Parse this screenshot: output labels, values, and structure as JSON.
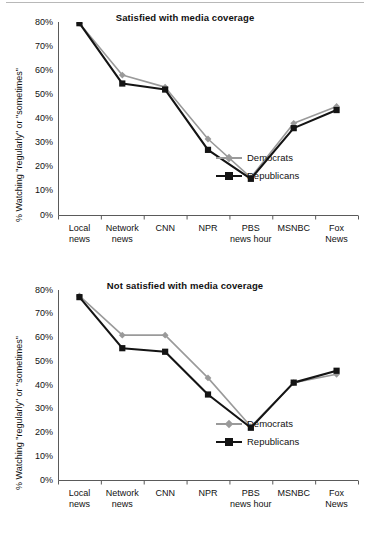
{
  "figure": {
    "background": "#ffffff",
    "ylabel": "% Watching \"regularly\" or \"sometimes\"",
    "ytick_labels": [
      "80%",
      "70%",
      "60%",
      "50%",
      "40%",
      "30%",
      "20%",
      "10%",
      "0%"
    ],
    "categories": [
      {
        "line1": "Local",
        "line2": "news"
      },
      {
        "line1": "Network",
        "line2": "news"
      },
      {
        "line1": "CNN",
        "line2": ""
      },
      {
        "line1": "NPR",
        "line2": ""
      },
      {
        "line1": "PBS",
        "line2": "news hour"
      },
      {
        "line1": "MSNBC",
        "line2": ""
      },
      {
        "line1": "Fox",
        "line2": "News"
      }
    ],
    "legend": {
      "democrats_label": "Democrats",
      "republicans_label": "Republicans"
    },
    "colors": {
      "democrats": "#9a9a9a",
      "republicans": "#141414",
      "axis": "#5a5a5a",
      "text": "#111111"
    }
  },
  "chart_data": [
    {
      "type": "line",
      "title": "Satisfied with media coverage",
      "xlabel": "",
      "ylabel": "% Watching \"regularly\" or \"sometimes\"",
      "ylim": [
        0,
        80
      ],
      "ytick_step": 10,
      "grid": false,
      "legend_position": "inside-right",
      "categories": [
        "Local news",
        "Network news",
        "CNN",
        "NPR",
        "PBS news hour",
        "MSNBC",
        "Fox News"
      ],
      "series": [
        {
          "name": "Democrats",
          "color": "#9a9a9a",
          "marker": "diamond",
          "values": [
            79.5,
            58,
            53,
            31.5,
            15.5,
            38,
            45
          ]
        },
        {
          "name": "Republicans",
          "color": "#141414",
          "marker": "square",
          "values": [
            79.5,
            54.5,
            52,
            27,
            15,
            36,
            43.5
          ]
        }
      ]
    },
    {
      "type": "line",
      "title": "Not satisfied with media coverage",
      "xlabel": "",
      "ylabel": "% Watching \"regularly\" or \"sometimes\"",
      "ylim": [
        0,
        80
      ],
      "ytick_step": 10,
      "grid": false,
      "legend_position": "inside-right",
      "categories": [
        "Local news",
        "Network news",
        "CNN",
        "NPR",
        "PBS news hour",
        "MSNBC",
        "Fox News"
      ],
      "series": [
        {
          "name": "Democrats",
          "color": "#9a9a9a",
          "marker": "diamond",
          "values": [
            77.5,
            61,
            61,
            43,
            22.5,
            41,
            44.5
          ]
        },
        {
          "name": "Republicans",
          "color": "#141414",
          "marker": "square",
          "values": [
            77,
            55.5,
            54,
            36,
            22,
            41,
            46
          ]
        }
      ]
    }
  ]
}
